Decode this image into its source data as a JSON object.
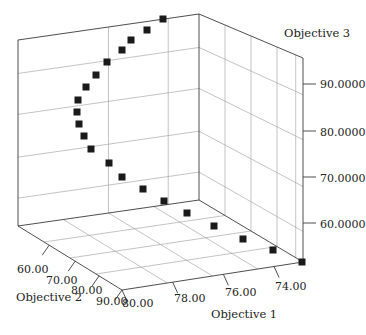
{
  "chart_data": {
    "type": "scatter",
    "dimension": "3d",
    "title": "",
    "axes": {
      "x": {
        "label": "Objective 1",
        "ticks": [
          "80.00",
          "78.00",
          "76.00",
          "74.00"
        ],
        "range": [
          80,
          73
        ]
      },
      "y": {
        "label": "Objective 2",
        "ticks": [
          "60.00",
          "70.00",
          "80.00",
          "90.00"
        ],
        "range": [
          55,
          95
        ]
      },
      "z": {
        "label": "Objective 3",
        "ticks": [
          "60.0000",
          "70.0000",
          "80.0000",
          "90.0000"
        ],
        "range": [
          52,
          100
        ]
      }
    },
    "grid": true,
    "marker": "square",
    "marker_color": "#1a1a1a",
    "points_screen": [
      [
        163,
        19
      ],
      [
        147,
        30
      ],
      [
        131,
        40
      ],
      [
        122,
        50
      ],
      [
        107,
        62
      ],
      [
        96,
        75
      ],
      [
        86,
        87
      ],
      [
        78,
        100
      ],
      [
        77,
        112
      ],
      [
        79,
        124
      ],
      [
        84,
        136
      ],
      [
        91,
        149
      ],
      [
        109,
        163
      ],
      [
        122,
        177
      ],
      [
        143,
        189
      ],
      [
        164,
        201
      ],
      [
        187,
        213
      ],
      [
        214,
        226
      ],
      [
        243,
        239
      ],
      [
        273,
        250
      ],
      [
        302,
        262
      ]
    ],
    "note": "Pareto front of 21 points; exact 3D coordinates not labeled, positions given in screen space"
  },
  "labels": {
    "objective1": "Objective 1",
    "objective2": "Objective 2",
    "objective3": "Objective 3"
  }
}
